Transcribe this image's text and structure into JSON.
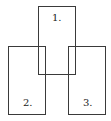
{
  "diagram": {
    "type": "overlapping-rectangles",
    "boxes": [
      {
        "id": 1,
        "label": "1."
      },
      {
        "id": 2,
        "label": "2."
      },
      {
        "id": 3,
        "label": "3."
      }
    ],
    "stroke_color": "#3a3a3a",
    "background": "#ffffff"
  }
}
